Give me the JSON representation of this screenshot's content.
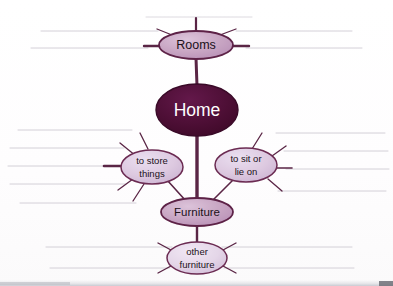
{
  "worksheet": {
    "title": "Home mind map worksheet",
    "paper_color": "#ffffff",
    "rule_line_color": "#cfcbd4",
    "branch_color": "#5a2545",
    "nodes": [
      {
        "id": "rooms",
        "label": "Rooms",
        "label_lines": [
          "Rooms"
        ],
        "style": "light",
        "fill": "#c9a7c4",
        "stroke": "#5d2247",
        "text_color": "#1b1119",
        "cx": 196,
        "cy": 45,
        "rx": 37,
        "ry": 14,
        "font_size": 12,
        "spokes": 5
      },
      {
        "id": "home",
        "label": "Home",
        "label_lines": [
          "Home"
        ],
        "style": "dark",
        "fill": "#4e0f36",
        "stroke": "#3a0a28",
        "text_color": "#ffffff",
        "cx": 197,
        "cy": 110,
        "rx": 41,
        "ry": 26,
        "font_size": 17,
        "spokes": 0
      },
      {
        "id": "to-store-things",
        "label": "to store things",
        "label_lines": [
          "to store",
          "things"
        ],
        "style": "light",
        "fill": "#ddc9e0",
        "stroke": "#6b2b52",
        "text_color": "#1b1119",
        "cx": 152,
        "cy": 167,
        "rx": 31,
        "ry": 17,
        "font_size": 9,
        "spokes": 4
      },
      {
        "id": "to-sit-or-lie-on",
        "label": "to sit or lie on",
        "label_lines": [
          "to sit or",
          "lie on"
        ],
        "style": "light",
        "fill": "#ddc9e0",
        "stroke": "#6b2b52",
        "text_color": "#1b1119",
        "cx": 246,
        "cy": 165,
        "rx": 31,
        "ry": 17,
        "font_size": 9,
        "spokes": 4
      },
      {
        "id": "furniture",
        "label": "Furniture",
        "label_lines": [
          "Furniture"
        ],
        "style": "light",
        "fill": "#c9a7c4",
        "stroke": "#5d2247",
        "text_color": "#1b1119",
        "cx": 197,
        "cy": 212,
        "rx": 36,
        "ry": 14,
        "font_size": 11,
        "spokes": 0
      },
      {
        "id": "other-furniture",
        "label": "other furniture",
        "label_lines": [
          "other",
          "furniture"
        ],
        "style": "light",
        "fill": "#e4d6e8",
        "stroke": "#6b2b52",
        "text_color": "#1b1119",
        "cx": 197,
        "cy": 258,
        "rx": 30,
        "ry": 16,
        "font_size": 9,
        "spokes": 4
      }
    ],
    "connectors": [
      {
        "from": "rooms",
        "to": "home",
        "thick": true
      },
      {
        "from": "home",
        "to": "furniture",
        "thick": true
      },
      {
        "from": "to-store-things",
        "to": "furniture",
        "thick": false
      },
      {
        "from": "to-sit-or-lie-on",
        "to": "furniture",
        "thick": false
      },
      {
        "from": "furniture",
        "to": "other-furniture",
        "thick": true
      }
    ],
    "answer_lines_note": "blank ruled lines for the student to write answers on"
  }
}
